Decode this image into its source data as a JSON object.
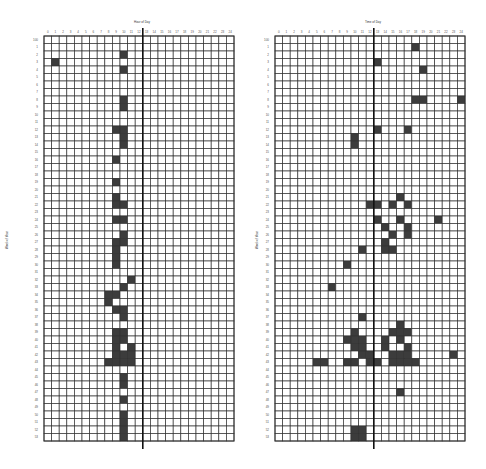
{
  "chart_data": [
    {
      "type": "heatmap",
      "title": "Hour of Day",
      "xlabel": "Hour of Day",
      "ylabel": "Week of Year",
      "n_cols": 25,
      "n_rows": 54,
      "divider_after_col": 12,
      "filled_color": "#3c3c3c",
      "empty_color": "#ffffff",
      "grid_color": "#333333",
      "x_ticks": [
        "0",
        "1",
        "2",
        "3",
        "4",
        "5",
        "6",
        "7",
        "8",
        "9",
        "10",
        "11",
        "12",
        "13",
        "14",
        "15",
        "16",
        "17",
        "18",
        "19",
        "20",
        "21",
        "22",
        "23",
        "24"
      ],
      "y_ticks": [
        "100",
        "1",
        "2",
        "3",
        "4",
        "5",
        "6",
        "7",
        "8",
        "9",
        "10",
        "11",
        "12",
        "13",
        "14",
        "15",
        "16",
        "17",
        "18",
        "19",
        "20",
        "21",
        "22",
        "23",
        "24",
        "25",
        "26",
        "27",
        "28",
        "29",
        "30",
        "31",
        "32",
        "33",
        "34",
        "35",
        "36",
        "37",
        "38",
        "39",
        "40",
        "41",
        "42",
        "43",
        "44",
        "45",
        "46",
        "47",
        "48",
        "49",
        "50",
        "51",
        "52",
        "53"
      ],
      "filled_cells": [
        [
          2,
          10
        ],
        [
          3,
          1
        ],
        [
          4,
          10
        ],
        [
          8,
          10
        ],
        [
          9,
          10
        ],
        [
          12,
          9
        ],
        [
          12,
          10
        ],
        [
          13,
          10
        ],
        [
          14,
          10
        ],
        [
          16,
          9
        ],
        [
          19,
          9
        ],
        [
          21,
          9
        ],
        [
          22,
          9
        ],
        [
          22,
          10
        ],
        [
          24,
          9
        ],
        [
          24,
          10
        ],
        [
          26,
          10
        ],
        [
          27,
          9
        ],
        [
          27,
          10
        ],
        [
          28,
          9
        ],
        [
          29,
          9
        ],
        [
          30,
          9
        ],
        [
          32,
          11
        ],
        [
          33,
          10
        ],
        [
          34,
          8
        ],
        [
          34,
          9
        ],
        [
          35,
          8
        ],
        [
          36,
          9
        ],
        [
          36,
          10
        ],
        [
          37,
          10
        ],
        [
          39,
          9
        ],
        [
          39,
          10
        ],
        [
          40,
          9
        ],
        [
          40,
          10
        ],
        [
          41,
          9
        ],
        [
          41,
          11
        ],
        [
          42,
          9
        ],
        [
          42,
          10
        ],
        [
          42,
          11
        ],
        [
          43,
          8
        ],
        [
          43,
          9
        ],
        [
          43,
          10
        ],
        [
          43,
          11
        ],
        [
          45,
          10
        ],
        [
          46,
          10
        ],
        [
          48,
          10
        ],
        [
          50,
          10
        ],
        [
          51,
          10
        ],
        [
          52,
          10
        ],
        [
          53,
          10
        ]
      ]
    },
    {
      "type": "heatmap",
      "title": "Time of Day",
      "xlabel": "Time of Day",
      "ylabel": "Week of Year",
      "n_cols": 25,
      "n_rows": 54,
      "divider_after_col": 12,
      "filled_color": "#3c3c3c",
      "empty_color": "#ffffff",
      "grid_color": "#333333",
      "x_ticks": [
        "0",
        "1",
        "2",
        "3",
        "4",
        "5",
        "6",
        "7",
        "8",
        "9",
        "10",
        "11",
        "12",
        "13",
        "14",
        "15",
        "16",
        "17",
        "18",
        "19",
        "20",
        "21",
        "22",
        "23",
        "24"
      ],
      "y_ticks": [
        "100",
        "1",
        "2",
        "3",
        "4",
        "5",
        "6",
        "7",
        "8",
        "9",
        "10",
        "11",
        "12",
        "13",
        "14",
        "15",
        "16",
        "17",
        "18",
        "19",
        "20",
        "21",
        "22",
        "23",
        "24",
        "25",
        "26",
        "27",
        "28",
        "29",
        "30",
        "31",
        "32",
        "33",
        "34",
        "35",
        "36",
        "37",
        "38",
        "39",
        "40",
        "41",
        "42",
        "43",
        "44",
        "45",
        "46",
        "47",
        "48",
        "49",
        "50",
        "51",
        "52",
        "53"
      ],
      "filled_cells": [
        [
          1,
          18
        ],
        [
          3,
          13
        ],
        [
          4,
          19
        ],
        [
          8,
          18
        ],
        [
          8,
          19
        ],
        [
          8,
          24
        ],
        [
          12,
          13
        ],
        [
          12,
          17
        ],
        [
          13,
          10
        ],
        [
          14,
          10
        ],
        [
          21,
          16
        ],
        [
          22,
          12
        ],
        [
          22,
          13
        ],
        [
          22,
          15
        ],
        [
          22,
          17
        ],
        [
          24,
          13
        ],
        [
          24,
          16
        ],
        [
          24,
          21
        ],
        [
          25,
          14
        ],
        [
          25,
          17
        ],
        [
          26,
          15
        ],
        [
          26,
          17
        ],
        [
          27,
          14
        ],
        [
          28,
          14
        ],
        [
          28,
          15
        ],
        [
          28,
          11
        ],
        [
          30,
          9
        ],
        [
          33,
          7
        ],
        [
          37,
          11
        ],
        [
          38,
          16
        ],
        [
          39,
          15
        ],
        [
          40,
          14
        ],
        [
          41,
          14
        ],
        [
          39,
          10
        ],
        [
          39,
          16
        ],
        [
          39,
          17
        ],
        [
          40,
          9
        ],
        [
          40,
          10
        ],
        [
          40,
          11
        ],
        [
          40,
          16
        ],
        [
          41,
          10
        ],
        [
          41,
          11
        ],
        [
          41,
          17
        ],
        [
          42,
          11
        ],
        [
          42,
          12
        ],
        [
          42,
          15
        ],
        [
          42,
          16
        ],
        [
          42,
          17
        ],
        [
          42,
          23
        ],
        [
          43,
          5
        ],
        [
          43,
          6
        ],
        [
          43,
          9
        ],
        [
          43,
          10
        ],
        [
          43,
          12
        ],
        [
          43,
          13
        ],
        [
          43,
          15
        ],
        [
          43,
          16
        ],
        [
          43,
          17
        ],
        [
          43,
          18
        ],
        [
          47,
          16
        ],
        [
          52,
          10
        ],
        [
          52,
          11
        ],
        [
          53,
          10
        ],
        [
          53,
          11
        ]
      ]
    }
  ]
}
